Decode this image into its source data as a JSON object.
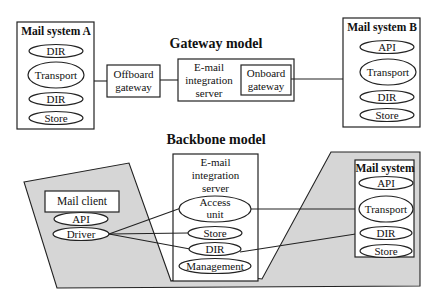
{
  "gateway_model": {
    "title": "Gateway model",
    "mail_system_a": {
      "title": "Mail system A",
      "components": [
        "DIR",
        "Transport",
        "DIR",
        "Store"
      ]
    },
    "offboard_gateway": {
      "line1": "Offboard",
      "line2": "gateway"
    },
    "integration_server": {
      "line1": "E-mail",
      "line2": "integration",
      "line3": "server",
      "onboard_gateway": {
        "line1": "Onboard",
        "line2": "gateway"
      }
    },
    "mail_system_b": {
      "title": "Mail system B",
      "components": [
        "API",
        "Transport",
        "DIR",
        "Store"
      ]
    }
  },
  "backbone_model": {
    "title": "Backbone model",
    "mail_client": {
      "title": "Mail client",
      "components": [
        "API",
        "Driver"
      ]
    },
    "integration_server": {
      "line1": "E-mail",
      "line2": "integration",
      "line3": "server",
      "access_unit": {
        "line1": "Access",
        "line2": "unit"
      },
      "components": [
        "Store",
        "DIR",
        "Management"
      ]
    },
    "mail_system": {
      "title": "Mail system",
      "components": [
        "API",
        "Transport",
        "DIR",
        "Store"
      ]
    }
  },
  "colors": {
    "shade": "#d6d6d6",
    "stroke": "#222222",
    "background": "#ffffff"
  }
}
